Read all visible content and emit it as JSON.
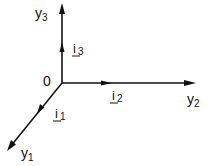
{
  "diagram": {
    "type": "coordinate-axes",
    "origin_label": "0",
    "axes": [
      {
        "name": "y1",
        "label": "y",
        "subscript": "1",
        "unit_vector": "i",
        "unit_subscript": "1"
      },
      {
        "name": "y2",
        "label": "y",
        "subscript": "2",
        "unit_vector": "i",
        "unit_subscript": "2"
      },
      {
        "name": "y3",
        "label": "y",
        "subscript": "3",
        "unit_vector": "i",
        "unit_subscript": "3"
      }
    ]
  }
}
